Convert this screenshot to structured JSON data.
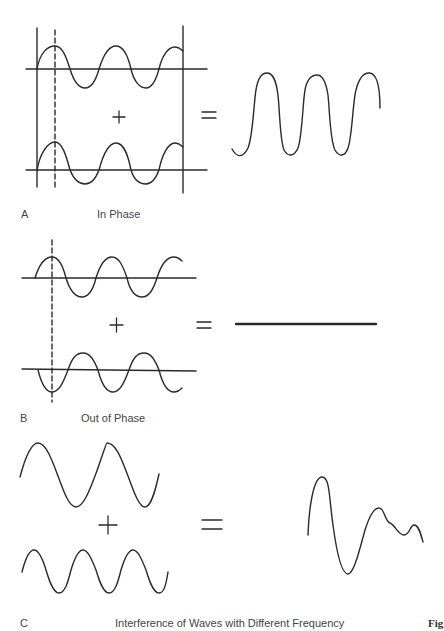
{
  "panels": [
    {
      "letter": "A",
      "caption": "In Phase",
      "operator_plus": "+",
      "operator_equals": "=",
      "result": "amplified wave (double amplitude, same frequency)"
    },
    {
      "letter": "B",
      "caption": "Out of Phase",
      "operator_plus": "+",
      "operator_equals": "=",
      "result": "flat line (cancellation)"
    },
    {
      "letter": "C",
      "caption": "Interference of Waves with Different Frequency",
      "operator_plus": "+",
      "operator_equals": "=",
      "result": "complex irregular wave"
    }
  ],
  "figure_tag": "Fig",
  "colors": {
    "stroke": "#2a2a2a",
    "background": "#ffffff"
  }
}
